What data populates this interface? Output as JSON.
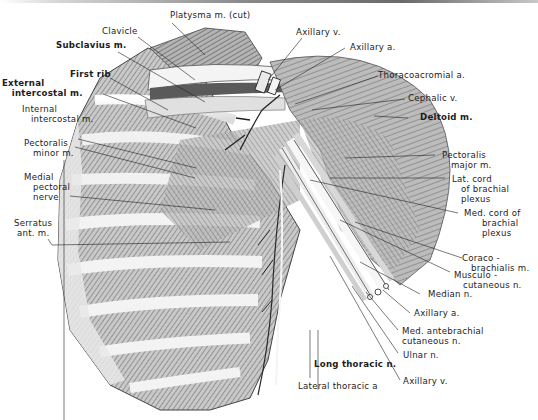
{
  "figure": {
    "colors": {
      "background": "#ffffff",
      "ink": "#1c1c1c",
      "muscle_shade": "#9a9a9a",
      "rib_highlight": "#f2f2f2"
    }
  },
  "labels": {
    "platysma": "Platysma m. (cut)",
    "clavicle": "Clavicle",
    "subclavius": "Subclavius m.",
    "first_rib": "First rib",
    "external_intercostal": "External\n   intercostal m.",
    "internal_intercostal": "Internal\n   intercostal m.",
    "pectoralis_minor": "Pectoralis\n   minor m.",
    "medial_pectoral_nerve": "Medial\n   pectoral\n   nerve",
    "serratus_anterior": "Serratus\n ant. m.",
    "axillary_v_top": "Axillary v.",
    "axillary_a_top": "Axillary a.",
    "thoracoacromial_a": "Thoracoacromial a.",
    "cephalic_v": "Cephalic v.",
    "deltoid": "Deltoid m.",
    "pectoralis_major": "Pectoralis\n   major m.",
    "lat_cord": "Lat. cord\n   of brachial\n   plexus",
    "med_cord": "Med. cord of\n      brachial\n      plexus",
    "coracobrachialis": "Coraco -\n   brachialis m.",
    "musculocutaneous": "Musculo -\n   cutaneous n.",
    "median_n": "Median n.",
    "axillary_a_bottom": "Axillary a.",
    "med_antebrachial": "Med. antebrachial\ncutaneous n.",
    "ulnar_n": "Ulnar n.",
    "axillary_v_bottom": "Axillary v.",
    "long_thoracic": "Long thoracic n.",
    "lateral_thoracic": "Lateral thoracic a"
  }
}
